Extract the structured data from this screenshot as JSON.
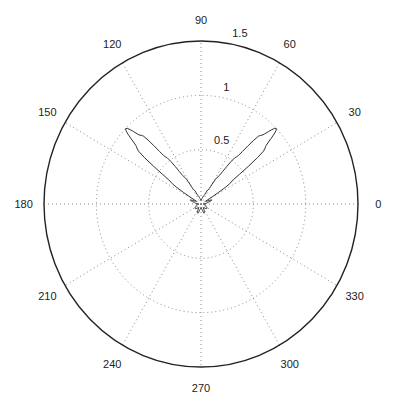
{
  "chart_data": {
    "type": "polar",
    "title": "",
    "theta_unit": "degrees",
    "r_ticks": [
      0.5,
      1,
      1.5
    ],
    "r_tick_labels": [
      "0.5",
      "1",
      "1.5"
    ],
    "rlim": [
      0,
      1.5
    ],
    "theta_ticks": [
      0,
      30,
      60,
      90,
      120,
      150,
      180,
      210,
      240,
      270,
      300,
      330
    ],
    "theta_tick_labels": [
      "0",
      "30",
      "60",
      "90",
      "120",
      "150",
      "180",
      "210",
      "240",
      "270",
      "300",
      "330"
    ],
    "grid": true,
    "series": [
      {
        "name": "radiation pattern",
        "color": "#333333",
        "points": [
          [
            0,
            0.02
          ],
          [
            10,
            0.06
          ],
          [
            20,
            0.11
          ],
          [
            25,
            0.06
          ],
          [
            30,
            0.05
          ],
          [
            35,
            0.35
          ],
          [
            40,
            0.8
          ],
          [
            44,
            1.0
          ],
          [
            48,
            0.85
          ],
          [
            52,
            0.55
          ],
          [
            57,
            0.3
          ],
          [
            62,
            0.15
          ],
          [
            70,
            0.08
          ],
          [
            80,
            0.05
          ],
          [
            90,
            0.03
          ],
          [
            100,
            0.05
          ],
          [
            110,
            0.08
          ],
          [
            118,
            0.15
          ],
          [
            123,
            0.3
          ],
          [
            128,
            0.55
          ],
          [
            132,
            0.85
          ],
          [
            136,
            1.0
          ],
          [
            140,
            0.8
          ],
          [
            145,
            0.35
          ],
          [
            150,
            0.05
          ],
          [
            155,
            0.06
          ],
          [
            160,
            0.11
          ],
          [
            170,
            0.06
          ],
          [
            180,
            0.02
          ],
          [
            200,
            0.05
          ],
          [
            215,
            0.07
          ],
          [
            235,
            0.04
          ],
          [
            250,
            0.09
          ],
          [
            260,
            0.05
          ],
          [
            270,
            0.03
          ],
          [
            280,
            0.05
          ],
          [
            290,
            0.09
          ],
          [
            305,
            0.04
          ],
          [
            325,
            0.07
          ],
          [
            340,
            0.05
          ],
          [
            360,
            0.02
          ]
        ]
      }
    ],
    "annotations": []
  },
  "colors": {
    "axis": "#222222",
    "grid": "#888888",
    "series": "#333333",
    "background": "#ffffff"
  }
}
